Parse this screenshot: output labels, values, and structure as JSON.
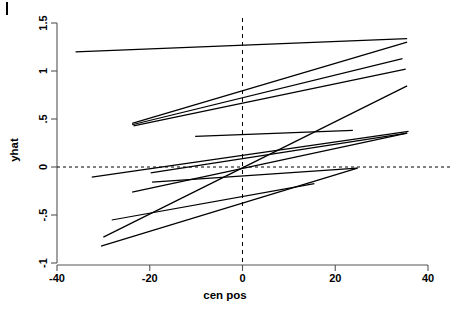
{
  "chart_data": {
    "type": "line",
    "title": "",
    "subtitle": "",
    "xlabel": "cen  pos",
    "ylabel": "yhat",
    "xlim": [
      -40,
      40
    ],
    "ylim": [
      -1,
      1.5
    ],
    "grid": false,
    "legend": null,
    "xticks": [
      -40,
      -20,
      0,
      20,
      40
    ],
    "xtick_labels": [
      "-40",
      "-20",
      "0",
      "20",
      "40"
    ],
    "yticks": [
      -1,
      -0.5,
      0,
      0.5,
      1,
      1.5
    ],
    "ytick_labels": [
      "-1",
      "-.5",
      "0",
      ".5",
      "1",
      "1.5"
    ],
    "reference_lines": [
      {
        "name": "y-zero-dashed",
        "orientation": "horizontal",
        "value": 0,
        "style": "dashed"
      },
      {
        "name": "x-zero-dashed",
        "orientation": "vertical",
        "value": 0,
        "style": "dashed"
      }
    ],
    "series": [
      {
        "name": "line-1",
        "x": [
          -36.0,
          35.5
        ],
        "y": [
          1.198,
          1.338
        ]
      },
      {
        "name": "line-2",
        "x": [
          -23.8,
          35.5
        ],
        "y": [
          0.455,
          1.3
        ]
      },
      {
        "name": "line-3",
        "x": [
          -23.8,
          34.5
        ],
        "y": [
          0.44,
          1.128
        ]
      },
      {
        "name": "line-4",
        "x": [
          -23.5,
          35.2
        ],
        "y": [
          0.428,
          1.02
        ]
      },
      {
        "name": "line-5",
        "x": [
          -30.0,
          35.5
        ],
        "y": [
          -0.73,
          0.845
        ]
      },
      {
        "name": "line-6",
        "x": [
          -10.2,
          23.8
        ],
        "y": [
          0.318,
          0.382
        ]
      },
      {
        "name": "line-7",
        "x": [
          -32.5,
          35.8
        ],
        "y": [
          -0.105,
          0.372
        ]
      },
      {
        "name": "line-8",
        "x": [
          -19.8,
          35.5
        ],
        "y": [
          -0.062,
          0.352
        ]
      },
      {
        "name": "line-9",
        "x": [
          -23.8,
          35.5
        ],
        "y": [
          -0.262,
          0.352
        ]
      },
      {
        "name": "line-10",
        "x": [
          -19.5,
          24.8
        ],
        "y": [
          -0.158,
          -0.012
        ]
      },
      {
        "name": "line-11",
        "x": [
          -28.2,
          15.5
        ],
        "y": [
          -0.552,
          -0.172
        ]
      },
      {
        "name": "line-12",
        "x": [
          -30.5,
          24.8
        ],
        "y": [
          -0.825,
          -0.012
        ]
      }
    ]
  },
  "axes": {
    "y_axis_label": "yhat",
    "x_axis_label": "cen  pos"
  }
}
